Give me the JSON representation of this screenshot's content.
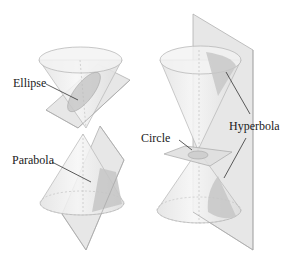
{
  "figure": {
    "background": "#ffffff",
    "colors": {
      "cone_fill": "#eeeeee",
      "cone_edge": "#b5b5b5",
      "plane_fill": "#e3e3e3",
      "plane_edge": "#a8a8a8",
      "section_fill": "#c8c8c8",
      "leader_line": "#333333",
      "label_text": "#1a1a1a"
    },
    "labels": {
      "ellipse": "Ellipse",
      "parabola": "Parabola",
      "circle": "Circle",
      "hyperbola": "Hyperbola"
    }
  }
}
